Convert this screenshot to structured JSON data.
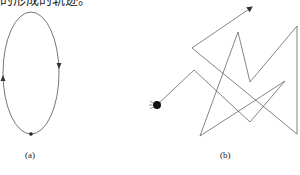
{
  "caption": {
    "top_text": "的形成的轨迹。"
  },
  "figure_a": {
    "label": "(a)",
    "shape": "ellipse",
    "description": "closed elliptical orbit with direction arrows and a point mass at bottom",
    "arrows": [
      "down-arrow-right-side",
      "up-arrow-left-side"
    ]
  },
  "figure_b": {
    "label": "(b)",
    "shape": "zigzag-path",
    "description": "random-walk zigzag trajectory starting from a particle, ending with an arrow",
    "points": [
      [
        157,
        105
      ],
      [
        194,
        70
      ],
      [
        250,
        122
      ],
      [
        285,
        81
      ],
      [
        200,
        136
      ],
      [
        238,
        32
      ],
      [
        250,
        82
      ],
      [
        297,
        26
      ],
      [
        297,
        134
      ],
      [
        192,
        48
      ],
      [
        252,
        7
      ]
    ]
  },
  "colors": {
    "line": "#555555",
    "particle": "#111111",
    "background": "#ffffff"
  }
}
